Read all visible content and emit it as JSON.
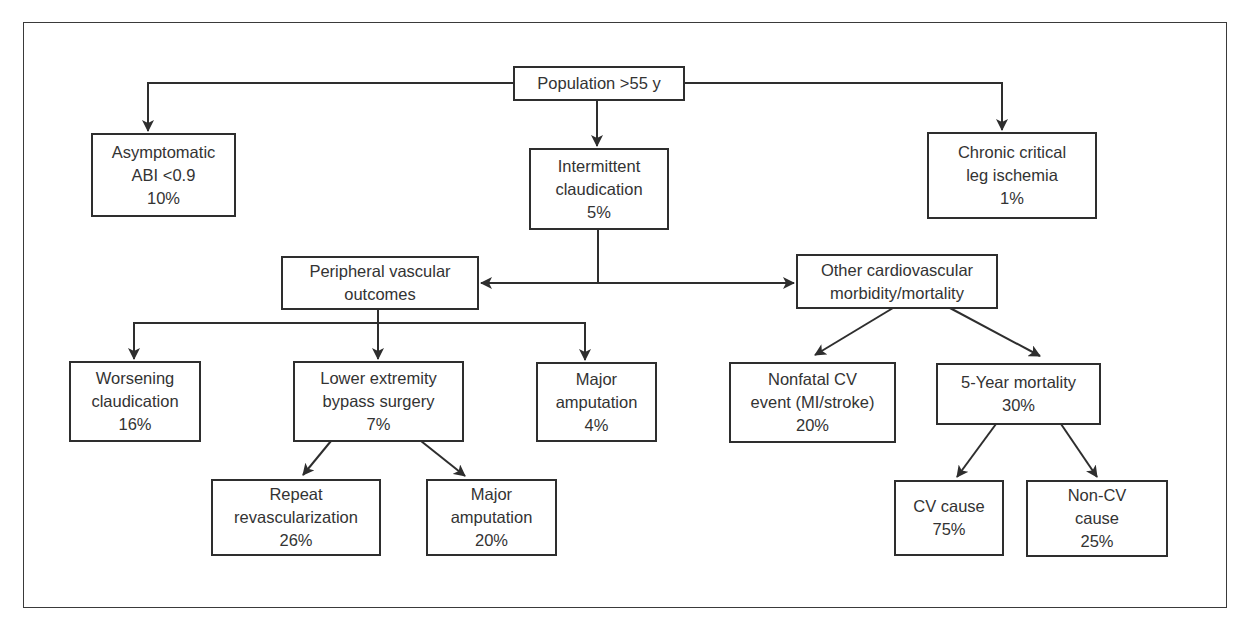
{
  "diagram": {
    "nodes": {
      "population": {
        "lines": [
          "Population >55 y"
        ]
      },
      "asymptomatic": {
        "lines": [
          "Asymptomatic",
          "ABI <0.9",
          "10%"
        ]
      },
      "intermittent": {
        "lines": [
          "Intermittent",
          "claudication",
          "5%"
        ]
      },
      "chronic": {
        "lines": [
          "Chronic critical",
          "leg ischemia",
          "1%"
        ]
      },
      "peripheral": {
        "lines": [
          "Peripheral vascular",
          "outcomes"
        ]
      },
      "other_cv": {
        "lines": [
          "Other cardiovascular",
          "morbidity/mortality"
        ]
      },
      "worsening": {
        "lines": [
          "Worsening",
          "claudication",
          "16%"
        ]
      },
      "bypass": {
        "lines": [
          "Lower extremity",
          "bypass surgery",
          "7%"
        ]
      },
      "amputation1": {
        "lines": [
          "Major",
          "amputation",
          "4%"
        ]
      },
      "nonfatal": {
        "lines": [
          "Nonfatal CV",
          "event (MI/stroke)",
          "20%"
        ]
      },
      "mortality": {
        "lines": [
          "5-Year mortality",
          "30%"
        ]
      },
      "repeat": {
        "lines": [
          "Repeat",
          "revascularization",
          "26%"
        ]
      },
      "amputation2": {
        "lines": [
          "Major",
          "amputation",
          "20%"
        ]
      },
      "cv_cause": {
        "lines": [
          "CV cause",
          "75%"
        ]
      },
      "noncv_cause": {
        "lines": [
          "Non-CV",
          "cause",
          "25%"
        ]
      }
    },
    "edges": [
      [
        "population",
        "asymptomatic"
      ],
      [
        "population",
        "intermittent"
      ],
      [
        "population",
        "chronic"
      ],
      [
        "intermittent",
        "peripheral"
      ],
      [
        "intermittent",
        "other_cv"
      ],
      [
        "peripheral",
        "worsening"
      ],
      [
        "peripheral",
        "bypass"
      ],
      [
        "peripheral",
        "amputation1"
      ],
      [
        "other_cv",
        "nonfatal"
      ],
      [
        "other_cv",
        "mortality"
      ],
      [
        "bypass",
        "repeat"
      ],
      [
        "bypass",
        "amputation2"
      ],
      [
        "mortality",
        "cv_cause"
      ],
      [
        "mortality",
        "noncv_cause"
      ]
    ],
    "colors": {
      "line": "#2e2e2e",
      "text": "#333333",
      "background": "#ffffff"
    }
  }
}
